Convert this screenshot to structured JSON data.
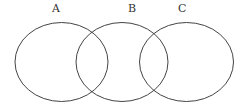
{
  "diagram": {
    "type": "venn",
    "stroke_color": "#444444",
    "sets": [
      {
        "label": "A",
        "cx": 61.5,
        "cy": 62,
        "rx": 46.5,
        "ry": 39.5,
        "label_x": 52,
        "label_y": 3
      },
      {
        "label": "B",
        "cx": 122,
        "cy": 62,
        "rx": 46,
        "ry": 39.5,
        "label_x": 128,
        "label_y": 3
      },
      {
        "label": "C",
        "cx": 186.5,
        "cy": 62,
        "rx": 47,
        "ry": 39.5,
        "label_x": 178,
        "label_y": 3
      }
    ]
  }
}
